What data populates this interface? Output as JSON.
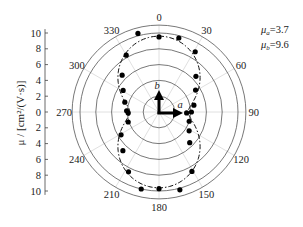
{
  "chart_data": {
    "type": "scatter",
    "subtype": "polar",
    "title": "",
    "ylabel": "μ / [cm²/(V·s)]",
    "radial_ticks": [
      "10",
      "8",
      "6",
      "4",
      "2",
      "0",
      "2",
      "4",
      "6",
      "8",
      "10"
    ],
    "radial_range": [
      0,
      11
    ],
    "radial_rings": [
      2,
      4,
      6,
      8,
      10,
      11
    ],
    "angle_ticks": [
      0,
      30,
      60,
      90,
      120,
      150,
      180,
      210,
      240,
      270,
      300,
      330
    ],
    "angle_direction": "clockwise-from-top",
    "grid": true,
    "legend": [
      {
        "label": "μa=3.7",
        "sym": "μ",
        "sub": "a",
        "value": "=3.7"
      },
      {
        "label": "μb=9.6",
        "sym": "μ",
        "sub": "b",
        "value": "=9.6"
      }
    ],
    "legend_position": "top-right",
    "fit": {
      "name": "fit",
      "style": "dash-dot",
      "mu_a": 3.7,
      "mu_b": 9.6
    },
    "axes_arrows": {
      "a_label": "a",
      "b_label": "b"
    },
    "series": [
      {
        "name": "measured",
        "marker": "filled-circle",
        "points": [
          {
            "angle": 0,
            "r": 9.5
          },
          {
            "angle": 15,
            "r": 9.7
          },
          {
            "angle": 31,
            "r": 8.9
          },
          {
            "angle": 46,
            "r": 6.5
          },
          {
            "angle": 59,
            "r": 5.4
          },
          {
            "angle": 79,
            "r": 4.5
          },
          {
            "angle": 90,
            "r": 4.1
          },
          {
            "angle": 92,
            "r": 3.5
          },
          {
            "angle": 107,
            "r": 4.0
          },
          {
            "angle": 122,
            "r": 4.5
          },
          {
            "angle": 135,
            "r": 5.5
          },
          {
            "angle": 151,
            "r": 8.6
          },
          {
            "angle": 165,
            "r": 10.2
          },
          {
            "angle": 180,
            "r": 9.7
          },
          {
            "angle": 193,
            "r": 10.0
          },
          {
            "angle": 207,
            "r": 8.5
          },
          {
            "angle": 223,
            "r": 6.7
          },
          {
            "angle": 239,
            "r": 5.6
          },
          {
            "angle": 252,
            "r": 4.1
          },
          {
            "angle": 268,
            "r": 3.9
          },
          {
            "angle": 272,
            "r": 4.1
          },
          {
            "angle": 286,
            "r": 4.5
          },
          {
            "angle": 301,
            "r": 5.3
          },
          {
            "angle": 315,
            "r": 6.6
          },
          {
            "angle": 330,
            "r": 8.3
          },
          {
            "angle": 345,
            "r": 10.3
          }
        ]
      }
    ]
  }
}
